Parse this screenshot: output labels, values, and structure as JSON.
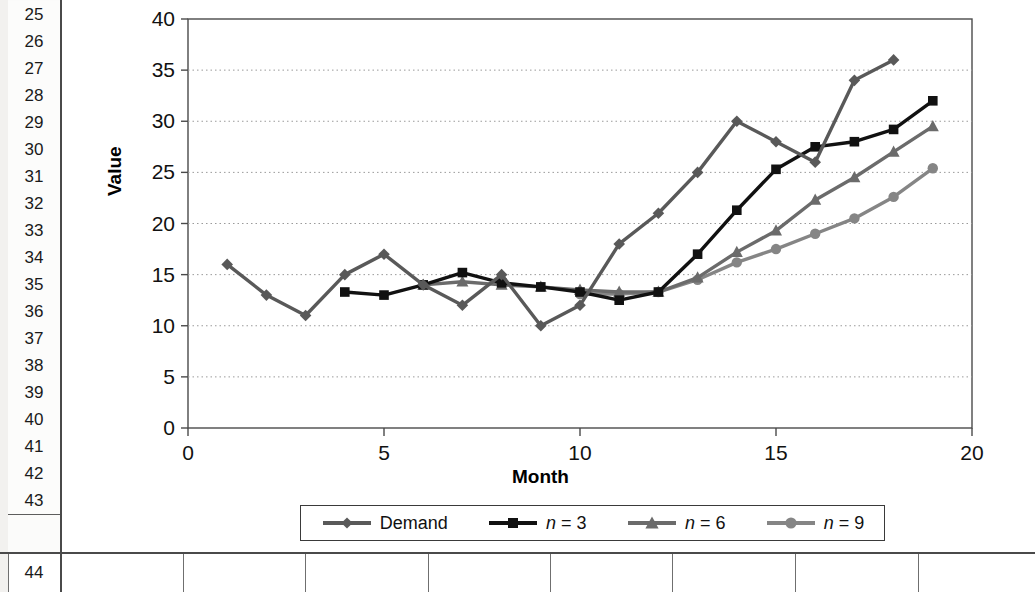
{
  "spreadsheet": {
    "row_headers": [
      "25",
      "26",
      "27",
      "28",
      "29",
      "30",
      "31",
      "32",
      "33",
      "34",
      "35",
      "36",
      "37",
      "38",
      "39",
      "40",
      "41",
      "42",
      "43"
    ],
    "bottom_row_header": "44",
    "bottom_row_cells": [
      "",
      "",
      "",
      "",
      "",
      "",
      "",
      ""
    ]
  },
  "chart_data": {
    "type": "line",
    "title": "",
    "xlabel": "Month",
    "ylabel": "Value",
    "xlim": [
      0,
      20
    ],
    "ylim": [
      0,
      40
    ],
    "xticks": [
      0,
      5,
      10,
      15,
      20
    ],
    "xtick_labels": [
      "0",
      "5",
      "10",
      "15",
      "20"
    ],
    "yticks": [
      0,
      5,
      10,
      15,
      20,
      25,
      30,
      35,
      40
    ],
    "ytick_labels": [
      "0",
      "5",
      "10",
      "15",
      "20",
      "25",
      "30",
      "35",
      "40"
    ],
    "grid": "horizontal-dotted",
    "legend_position": "bottom",
    "series": [
      {
        "name": "Demand",
        "marker": "diamond",
        "color": "#595959",
        "x": [
          1,
          2,
          3,
          4,
          5,
          6,
          7,
          8,
          9,
          10,
          11,
          12,
          13,
          14,
          15,
          16,
          17,
          18
        ],
        "values": [
          16,
          13,
          11,
          15,
          17,
          14,
          12,
          15,
          10,
          12,
          18,
          21,
          25,
          30,
          28,
          26,
          34,
          36
        ]
      },
      {
        "name": "n = 3",
        "marker": "square",
        "color": "#111111",
        "x": [
          4,
          5,
          6,
          7,
          8,
          9,
          10,
          11,
          12,
          13,
          14,
          15,
          16,
          17,
          18,
          19
        ],
        "values": [
          13.3,
          13,
          14,
          15.2,
          14.2,
          13.8,
          13.3,
          12.5,
          13.3,
          17,
          21.3,
          25.3,
          27.5,
          28,
          29.2,
          32
        ]
      },
      {
        "name": "n = 6",
        "marker": "triangle",
        "color": "#6b6b6b",
        "x": [
          6,
          7,
          8,
          9,
          10,
          11,
          12,
          13,
          14,
          15,
          16,
          17,
          18,
          19
        ],
        "values": [
          14,
          14.3,
          14,
          13.8,
          13.5,
          13.3,
          13.3,
          14.7,
          17.2,
          19.3,
          22.3,
          24.5,
          27,
          29.5
        ]
      },
      {
        "name": "n = 9",
        "marker": "circle",
        "color": "#858585",
        "x": [
          10,
          11,
          12,
          13,
          14,
          15,
          16,
          17,
          18,
          19
        ],
        "values": [
          13.1,
          13.1,
          13.3,
          14.5,
          16.2,
          17.5,
          19,
          20.5,
          22.6,
          25.4
        ]
      }
    ]
  }
}
